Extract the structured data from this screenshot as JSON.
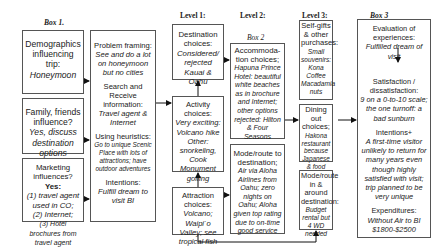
{
  "headers": {
    "box1": "Box 1.",
    "level1": "Level 1:",
    "level2": "Level 2:",
    "box2": "Box 2",
    "level3": "Level 3:",
    "box3": "Box 3"
  },
  "box1": {
    "demographics": {
      "label": "Demographics influencing trip:",
      "value": "Honeymoon"
    },
    "family": {
      "label": "Family, friends influence?",
      "value": "Yes, discuss destination options"
    },
    "marketing": {
      "label": "Marketing influences?",
      "answer": "Yes:",
      "items": [
        "(1) travel agent used in CO;",
        "(2) Internet;",
        "(3) Hotel brochures from travel agent"
      ]
    }
  },
  "process": {
    "problem": {
      "label": "Problem framing:",
      "value": "See and do a lot on honeymoon but no cities"
    },
    "search": {
      "label": "Search and Receive information:",
      "value": "Travel agent & Internet"
    },
    "heuristics": {
      "label": "Using heuristics:",
      "value": "Go to unique Scenic Place with lots of attractions; have outdoor adventures"
    },
    "intentions": {
      "label": "Intentions:",
      "value": "Fulfill dream to visit BI"
    }
  },
  "level1": {
    "destination": {
      "label": "Destination choices:",
      "value": "Considered/ rejected Kauai & Oahu"
    },
    "activity": {
      "label": "Activity choices:",
      "value1": "Very exciting: Volcano hike",
      "value2": "Other: snorkeling, Cook Monument golfing"
    },
    "attraction": {
      "label": "Attraction choices:",
      "value": "Volcano; Waipi`o Valley; see tropical fish"
    }
  },
  "level2": {
    "accommodation": {
      "label": "Accommoda-tion choices;",
      "value": "Hapuna Prince Hotel: beautiful white beaches as in brochure and Internet; other options rejected: Hilton & Four Seasons"
    },
    "mode": {
      "label": "Mode/route to destination;",
      "value": "Air via Aloha Airlines from Oahu; zero nights on Oahu; Aloha given top rating due to on-time good service"
    }
  },
  "level3": {
    "selfgifts": {
      "label": "Self-gifts & other purchases:",
      "value": "Small souvenirs: Kona Coffee Macadamia nuts"
    },
    "dining": {
      "label": "Dining out choices;",
      "value": "Hakona restaurant because Japanese & food quality"
    },
    "moderoute": {
      "label": "Mode/route in & around destination:",
      "value": "Budget rental but 4 WD needed"
    }
  },
  "box3": {
    "evaluation": {
      "label": "Evaluation of experiences:",
      "value": "Fulfilled dream of visit"
    },
    "satisfaction": {
      "label": "Satisfaction / dissatisfaction:",
      "value": "9 on a 0-to-10 scale; the one turnoff: a bad sunburn"
    },
    "intentions": {
      "label": "Intentions+",
      "value": "A first-time visitor unlikely to return for many years even though highly satisfied with visit; trip planned to be very unique"
    },
    "expenditures": {
      "label": "Expenditures:",
      "value": "Without Air to BI $1800-$2500"
    }
  }
}
